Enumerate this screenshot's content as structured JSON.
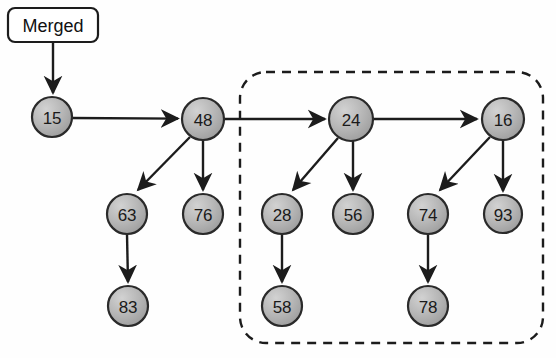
{
  "diagram": {
    "background_color": "#fefefe",
    "node_fill_color": "#b2b2b2",
    "node_stroke_color": "#2a2a2a",
    "edge_color": "#1c1c1c",
    "label": {
      "text": "Merged",
      "x": 53,
      "y": 25,
      "width": 90,
      "height": 34
    },
    "group_box": {
      "name": "dashed-selection-region",
      "x": 240,
      "y": 72,
      "width": 303,
      "height": 271,
      "corner_radius": 26,
      "style": "dashed"
    },
    "nodes": [
      {
        "id": "n15",
        "value": "15",
        "cx": 52,
        "cy": 117,
        "r": 20
      },
      {
        "id": "n48",
        "value": "48",
        "cx": 203,
        "cy": 119,
        "r": 21
      },
      {
        "id": "n24",
        "value": "24",
        "cx": 351,
        "cy": 119,
        "r": 22
      },
      {
        "id": "n16",
        "value": "16",
        "cx": 503,
        "cy": 119,
        "r": 21
      },
      {
        "id": "n63",
        "value": "63",
        "cx": 127,
        "cy": 214,
        "r": 20
      },
      {
        "id": "n76",
        "value": "76",
        "cx": 203,
        "cy": 214,
        "r": 20
      },
      {
        "id": "n28",
        "value": "28",
        "cx": 282,
        "cy": 214,
        "r": 20
      },
      {
        "id": "n56",
        "value": "56",
        "cx": 353,
        "cy": 214,
        "r": 20
      },
      {
        "id": "n74",
        "value": "74",
        "cx": 428,
        "cy": 214,
        "r": 20
      },
      {
        "id": "n93",
        "value": "93",
        "cx": 503,
        "cy": 214,
        "r": 19
      },
      {
        "id": "n83",
        "value": "83",
        "cx": 128,
        "cy": 306,
        "r": 20
      },
      {
        "id": "n58",
        "value": "58",
        "cx": 282,
        "cy": 306,
        "r": 20
      },
      {
        "id": "n78",
        "value": "78",
        "cx": 428,
        "cy": 306,
        "r": 20
      }
    ],
    "edges": [
      {
        "from": "label",
        "to": "n15",
        "kind": "arrow"
      },
      {
        "from": "n15",
        "to": "n48",
        "kind": "arrow"
      },
      {
        "from": "n48",
        "to": "n24",
        "kind": "arrow"
      },
      {
        "from": "n24",
        "to": "n16",
        "kind": "arrow"
      },
      {
        "from": "n48",
        "to": "n63",
        "kind": "arrow"
      },
      {
        "from": "n48",
        "to": "n76",
        "kind": "arrow"
      },
      {
        "from": "n24",
        "to": "n28",
        "kind": "arrow"
      },
      {
        "from": "n24",
        "to": "n56",
        "kind": "arrow"
      },
      {
        "from": "n16",
        "to": "n74",
        "kind": "arrow"
      },
      {
        "from": "n16",
        "to": "n93",
        "kind": "arrow"
      },
      {
        "from": "n63",
        "to": "n83",
        "kind": "arrow"
      },
      {
        "from": "n28",
        "to": "n58",
        "kind": "arrow"
      },
      {
        "from": "n74",
        "to": "n78",
        "kind": "arrow"
      }
    ]
  }
}
